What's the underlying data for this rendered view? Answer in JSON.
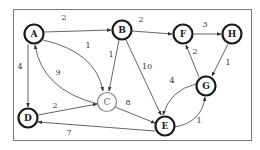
{
  "diagram": {
    "type": "directed-weighted-graph",
    "nodes": [
      {
        "id": "A",
        "label": "A",
        "x": 34,
        "y": 34,
        "style": "bold"
      },
      {
        "id": "B",
        "label": "B",
        "x": 122,
        "y": 30,
        "style": "bold"
      },
      {
        "id": "F",
        "label": "F",
        "x": 183,
        "y": 34,
        "style": "bold"
      },
      {
        "id": "H",
        "label": "H",
        "x": 232,
        "y": 34,
        "style": "bold"
      },
      {
        "id": "C",
        "label": "C",
        "x": 107,
        "y": 102,
        "style": "light"
      },
      {
        "id": "D",
        "label": "D",
        "x": 28,
        "y": 118,
        "style": "bold"
      },
      {
        "id": "E",
        "label": "E",
        "x": 165,
        "y": 126,
        "style": "bold"
      },
      {
        "id": "G",
        "label": "G",
        "x": 206,
        "y": 86,
        "style": "bold"
      }
    ],
    "edges": [
      {
        "from": "A",
        "to": "B",
        "weight": "2"
      },
      {
        "from": "A",
        "to": "C",
        "weight": "1"
      },
      {
        "from": "C",
        "to": "A",
        "weight": "9"
      },
      {
        "from": "A",
        "to": "D",
        "weight": "4"
      },
      {
        "from": "B",
        "to": "C",
        "weight": "1"
      },
      {
        "from": "B",
        "to": "E",
        "weight": "10"
      },
      {
        "from": "B",
        "to": "F",
        "weight": "2"
      },
      {
        "from": "F",
        "to": "H",
        "weight": "3"
      },
      {
        "from": "H",
        "to": "G",
        "weight": "1"
      },
      {
        "from": "G",
        "to": "F",
        "weight": "2"
      },
      {
        "from": "G",
        "to": "E",
        "weight": "4"
      },
      {
        "from": "E",
        "to": "G",
        "weight": "1"
      },
      {
        "from": "D",
        "to": "C",
        "weight": "2"
      },
      {
        "from": "C",
        "to": "E",
        "weight": "8"
      },
      {
        "from": "E",
        "to": "D",
        "weight": "7"
      }
    ]
  },
  "nodes": {
    "A": "A",
    "B": "B",
    "C": "C",
    "D": "D",
    "E": "E",
    "F": "F",
    "G": "G",
    "H": "H"
  },
  "weights": {
    "ab": "2",
    "ac": "1",
    "ca": "9",
    "ad": "4",
    "bc": "1",
    "be": "10",
    "bf": "2",
    "fh": "3",
    "hg": "1",
    "gf": "2",
    "ge": "4",
    "eg": "1",
    "dc": "2",
    "ce": "8",
    "ed": "7"
  }
}
